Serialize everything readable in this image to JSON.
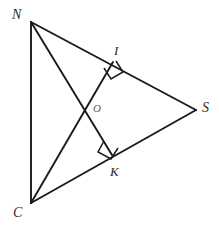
{
  "figure": {
    "background_color": "#ffffff",
    "stroke_color": "#1a1a1a",
    "label_color": "#2a2a2a"
  },
  "points": {
    "N": {
      "label": "N",
      "x": 31,
      "y": 22,
      "label_x": 12,
      "label_y": 8
    },
    "C": {
      "label": "C",
      "x": 31,
      "y": 203,
      "label_x": 13,
      "label_y": 206
    },
    "S": {
      "label": "S",
      "x": 196,
      "y": 110,
      "label_x": 202,
      "label_y": 101
    },
    "I": {
      "label": "I",
      "x": 113,
      "y": 62,
      "label_x": 114,
      "label_y": 44
    },
    "K": {
      "label": "K",
      "x": 112,
      "y": 155,
      "label_x": 110,
      "label_y": 165
    },
    "O": {
      "label": "O",
      "x": 88,
      "y": 110,
      "label_x": 93,
      "label_y": 103
    }
  },
  "segments": [
    {
      "name": "side-NC",
      "from": "N",
      "to": "C"
    },
    {
      "name": "side-NS",
      "from": "N",
      "to": "S"
    },
    {
      "name": "side-CS",
      "from": "C",
      "to": "S"
    },
    {
      "name": "altitude-CI",
      "from": "C",
      "to": "I"
    },
    {
      "name": "altitude-NK",
      "from": "N",
      "to": "K"
    }
  ],
  "right_angles": [
    {
      "name": "right-angle-at-I",
      "vertex": "I",
      "size": 11
    },
    {
      "name": "right-angle-at-K",
      "vertex": "K",
      "size": 11
    }
  ],
  "geometry_paths": {
    "side_NC": "M 31 22 L 31 203",
    "side_NS": "M 31 22 L 196 110",
    "side_CS": "M 31 203 L 196 110",
    "altitude_CI": "M 31 203 L 113 62",
    "altitude_NK": "M 31 22 L 112 155",
    "right_angle_I": "M 104 68 L 111 79 L 123 72 L 116 61",
    "right_angle_K": "M 104 141 L 98 152 L 111 159 L 118 148"
  }
}
